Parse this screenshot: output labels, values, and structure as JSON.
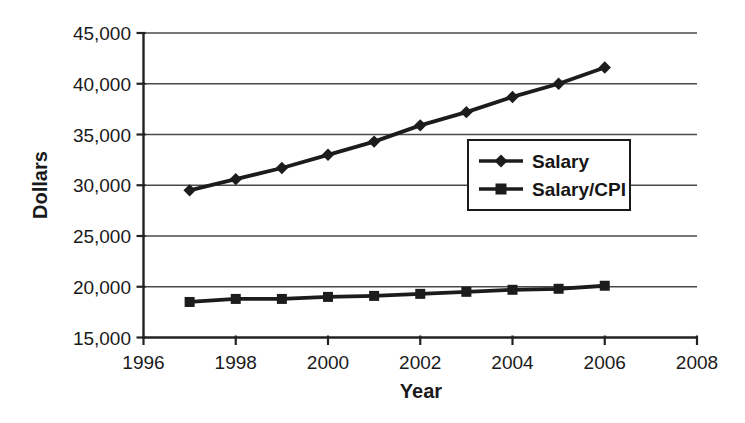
{
  "chart_data": {
    "type": "line",
    "title": "",
    "xlabel": "Year",
    "ylabel": "Dollars",
    "x": [
      1997,
      1998,
      1999,
      2000,
      2001,
      2002,
      2003,
      2004,
      2005,
      2006
    ],
    "series": [
      {
        "name": "Salary",
        "marker": "diamond",
        "color": "#1c1c1c",
        "values": [
          29500,
          30600,
          31700,
          33000,
          34300,
          35900,
          37200,
          38700,
          40000,
          41600
        ]
      },
      {
        "name": "Salary/CPI",
        "marker": "square",
        "color": "#1c1c1c",
        "values": [
          18500,
          18800,
          18800,
          19000,
          19100,
          19300,
          19500,
          19700,
          19800,
          20100
        ]
      }
    ],
    "xlim": [
      1996,
      2008
    ],
    "ylim": [
      15000,
      45000
    ],
    "x_ticks": {
      "values": [
        1996,
        1998,
        2000,
        2002,
        2004,
        2006,
        2008
      ],
      "labels": [
        "1996",
        "1998",
        "2000",
        "2002",
        "2004",
        "2006",
        "2008"
      ]
    },
    "y_ticks": {
      "values": [
        15000,
        20000,
        25000,
        30000,
        35000,
        40000,
        45000
      ],
      "labels": [
        "15,000",
        "20,000",
        "25,000",
        "30,000",
        "35,000",
        "40,000",
        "45,000"
      ]
    },
    "grid": "horizontal-only",
    "legend_position": "inside-right",
    "axis_color": "#222222",
    "grid_color": "#4a4a4a"
  }
}
